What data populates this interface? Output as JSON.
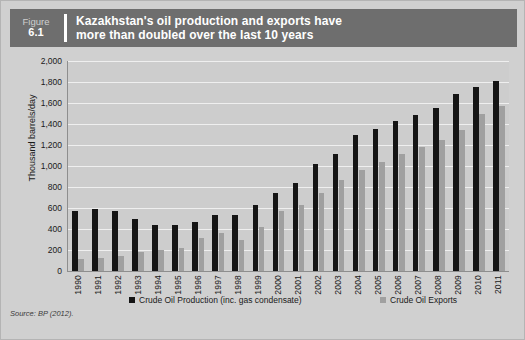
{
  "figure": {
    "label": "Figure",
    "number": "6.1",
    "title_line1": "Kazakhstan's oil production and exports have",
    "title_line2": "more than doubled over the last 10 years",
    "header_bg": "#6e6e6e",
    "panel_bg": "#d0d0d0",
    "plot_bg": "#cdcdcd"
  },
  "source": "Source: BP (2012).",
  "chart_data": {
    "type": "bar",
    "title": "Kazakhstan's oil production and exports have more than doubled over the last 10 years",
    "xlabel": "",
    "ylabel": "Thousand barrels/day",
    "ylim": [
      0,
      2000
    ],
    "yticks": [
      0,
      200,
      400,
      600,
      800,
      1000,
      1200,
      1400,
      1600,
      1800,
      2000
    ],
    "ytick_labels": [
      "0",
      "200",
      "400",
      "600",
      "800",
      "1,000",
      "1,200",
      "1,400",
      "1,600",
      "1,800",
      "2,000"
    ],
    "grid": true,
    "legend_position": "bottom",
    "categories": [
      "1990",
      "1991",
      "1992",
      "1993",
      "1994",
      "1995",
      "1996",
      "1997",
      "1998",
      "1999",
      "2000",
      "2001",
      "2002",
      "2003",
      "2004",
      "2005",
      "2006",
      "2007",
      "2008",
      "2009",
      "2010",
      "2011"
    ],
    "series": [
      {
        "name": "Crude Oil Production (inc. gas condensate)",
        "color": "#151515",
        "values": [
          570,
          590,
          570,
          500,
          440,
          440,
          470,
          535,
          535,
          630,
          744,
          836,
          1018,
          1111,
          1297,
          1356,
          1426,
          1484,
          1554,
          1682,
          1757,
          1810
        ]
      },
      {
        "name": "Crude Oil Exports",
        "color": "#a0a0a0",
        "values": [
          115,
          125,
          140,
          185,
          200,
          215,
          310,
          360,
          300,
          420,
          568,
          624,
          740,
          870,
          965,
          1040,
          1117,
          1178,
          1250,
          1340,
          1496,
          1570
        ]
      }
    ]
  },
  "legend": [
    {
      "label": "Crude Oil Production (inc. gas condensate)",
      "color": "#151515"
    },
    {
      "label": "Crude Oil Exports",
      "color": "#a0a0a0"
    }
  ]
}
